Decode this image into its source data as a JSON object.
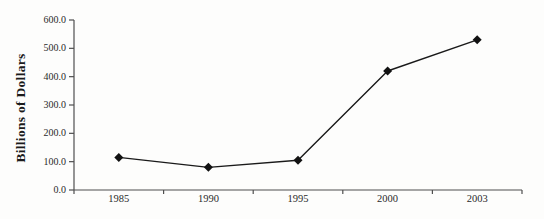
{
  "chart_data": {
    "type": "line",
    "categories": [
      "1985",
      "1990",
      "1995",
      "2000",
      "2003"
    ],
    "values": [
      115,
      80,
      105,
      420,
      530
    ],
    "series": [
      {
        "name": "Billions of Dollars",
        "values": [
          115,
          80,
          105,
          420,
          530
        ]
      }
    ],
    "title": "",
    "xlabel": "",
    "ylabel": "Billions of Dollars",
    "ylim": [
      0,
      600
    ],
    "ytick_step": 100,
    "ytick_decimals": 1,
    "grid": false,
    "legend_position": "none",
    "marker": "diamond",
    "colors": {
      "line": "#1a1a1a",
      "marker": "#121212",
      "axis": "#4f4f4f",
      "tick_text": "#2a2a2a",
      "background": "#fdfdfc"
    }
  }
}
